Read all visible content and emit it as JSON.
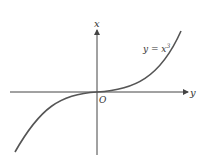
{
  "diagram": {
    "type": "function-graph",
    "axes": {
      "horizontal_label": "y",
      "vertical_label": "x",
      "origin_label": "O"
    },
    "curve": {
      "label_base": "y = x",
      "label_exponent": "3",
      "equation": "y = x^3"
    },
    "colors": {
      "axis": "#444444",
      "curve": "#555555",
      "text": "#333333",
      "background": "#ffffff"
    }
  }
}
